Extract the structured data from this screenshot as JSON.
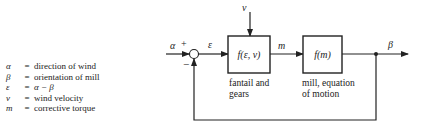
{
  "legend": [
    {
      "symbol": "α",
      "equals": "=",
      "definition": "direction of wind"
    },
    {
      "symbol": "β",
      "equals": "=",
      "definition": "orientation of mill"
    },
    {
      "symbol": "ε",
      "equals": "=",
      "definition": "α − β"
    },
    {
      "symbol": "v",
      "equals": "=",
      "definition": "wind velocity"
    },
    {
      "symbol": "m",
      "equals": "=",
      "definition": "corrective torque"
    }
  ],
  "diagram": {
    "input_label": "α",
    "plus_sign": "+",
    "minus_sign": "−",
    "error_label": "ε",
    "disturbance_label": "v",
    "block1": {
      "function": "f(ε, v)",
      "caption_line1": "fantail and",
      "caption_line2": "gears"
    },
    "intermediate_label": "m",
    "block2": {
      "function": "f(m)",
      "caption_line1": "mill, equation",
      "caption_line2": "of motion"
    },
    "output_label": "β"
  },
  "colors": {
    "line": "#222222",
    "background": "#ffffff"
  }
}
